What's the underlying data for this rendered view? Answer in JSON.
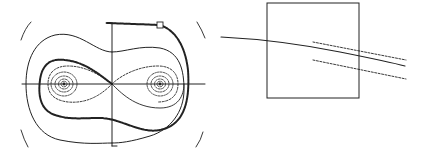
{
  "figure": {
    "panels": [
      {
        "id": "phase-portrait",
        "description": "Double-well phase portrait with separatrix figure-eight, nested closed orbits around two centers, and a highlighted trajectory with a square marker",
        "axes": {
          "horizontal": true,
          "vertical": true
        },
        "centers": 2,
        "marker": "square"
      },
      {
        "id": "zoom-box",
        "description": "Square inset containing a solid curve crossing between two dashed parallel lines"
      }
    ],
    "colors": {
      "line": "#222222",
      "background": "#ffffff"
    }
  }
}
